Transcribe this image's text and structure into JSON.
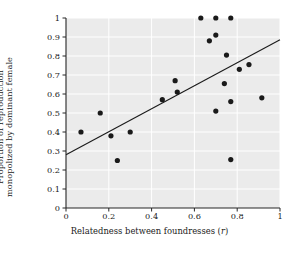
{
  "chart_data": {
    "type": "scatter",
    "title": "",
    "xlabel": "Relatedness between foundresses (r)",
    "xlabel_main": "Relatedness between foundresses (",
    "xlabel_italic": "r",
    "xlabel_tail": ")",
    "ylabel_line1": "Proportion of reproduction",
    "ylabel_line2": "monopolized by dominant female",
    "xlim": [
      0,
      1
    ],
    "ylim": [
      0,
      1
    ],
    "xticks": [
      0,
      0.2,
      0.4,
      0.6,
      0.8,
      1
    ],
    "xticklabels": [
      "0",
      "0.2",
      "0.4",
      "0.6",
      "0.8",
      "1"
    ],
    "yticks": [
      0,
      0.1,
      0.2,
      0.3,
      0.4,
      0.5,
      0.6,
      0.7,
      0.8,
      0.9,
      1
    ],
    "yticklabels": [
      "0",
      "0.1",
      "0.2",
      "0.3",
      "0.4",
      "0.5",
      "0.6",
      "0.7",
      "0.8",
      "0.9",
      "1"
    ],
    "grid": true,
    "grid_color": "#ffffff",
    "plot_background": "#ebebeb",
    "legend": null,
    "marker_color": "#1a1a1a",
    "marker_size": 2.6,
    "line_color": "#1a1a1a",
    "points": [
      {
        "x": 0.07,
        "y": 0.4
      },
      {
        "x": 0.16,
        "y": 0.5
      },
      {
        "x": 0.21,
        "y": 0.38
      },
      {
        "x": 0.24,
        "y": 0.25
      },
      {
        "x": 0.3,
        "y": 0.4
      },
      {
        "x": 0.45,
        "y": 0.57
      },
      {
        "x": 0.51,
        "y": 0.67
      },
      {
        "x": 0.52,
        "y": 0.61
      },
      {
        "x": 0.63,
        "y": 1.0
      },
      {
        "x": 0.67,
        "y": 0.88
      },
      {
        "x": 0.7,
        "y": 1.0
      },
      {
        "x": 0.7,
        "y": 0.91
      },
      {
        "x": 0.7,
        "y": 0.51
      },
      {
        "x": 0.74,
        "y": 0.655
      },
      {
        "x": 0.75,
        "y": 0.805
      },
      {
        "x": 0.77,
        "y": 1.0
      },
      {
        "x": 0.77,
        "y": 0.56
      },
      {
        "x": 0.77,
        "y": 0.255
      },
      {
        "x": 0.81,
        "y": 0.73
      },
      {
        "x": 0.855,
        "y": 0.755
      },
      {
        "x": 0.915,
        "y": 0.58
      }
    ],
    "regression_line": {
      "x0": 0.0,
      "y0": 0.28,
      "x1": 1.0,
      "y1": 0.885,
      "width": 1.1
    },
    "axes_box": {
      "left": 66,
      "top": 18,
      "width": 214,
      "height": 190
    }
  }
}
